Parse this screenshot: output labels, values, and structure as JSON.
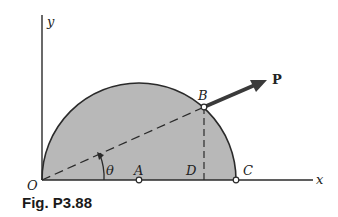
{
  "figure": {
    "caption": "Fig. P3.88",
    "axes": {
      "x_label": "x",
      "y_label": "y"
    },
    "points": {
      "O": "O",
      "A": "A",
      "B": "B",
      "C": "C",
      "D": "D"
    },
    "force_label": "P",
    "angle_label": "θ",
    "colors": {
      "fill": "#b8b8b8",
      "stroke": "#2a2a2a",
      "arrow": "#3a3a3a",
      "background": "#ffffff"
    }
  }
}
